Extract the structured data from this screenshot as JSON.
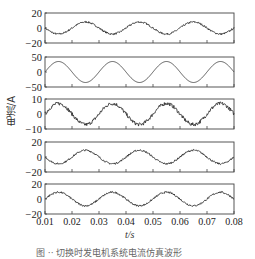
{
  "chart_data": {
    "type": "line",
    "layout": "5 vertically stacked subplots sharing x-axis",
    "xlabel": "t/s",
    "ylabel": "电流/A",
    "xlim": [
      0.01,
      0.08
    ],
    "xticks": [
      "0.01",
      "0.02",
      "0.03",
      "0.04",
      "0.05",
      "0.06",
      "0.07",
      "0.08"
    ],
    "grid": false,
    "legend": null,
    "panels": [
      {
        "name": "panel-1",
        "ylim": [
          -20,
          20
        ],
        "yticks": [
          "20",
          "0",
          "-20"
        ],
        "waveform": "sine",
        "frequency_hz": 50,
        "amplitude": 8,
        "phase": "negative-sine",
        "noise": "moderate"
      },
      {
        "name": "panel-2",
        "ylim": [
          -50,
          50
        ],
        "yticks": [
          "50",
          "0",
          "-50"
        ],
        "waveform": "sine",
        "frequency_hz": 50,
        "amplitude": 35,
        "phase": "positive-sine",
        "noise": "none"
      },
      {
        "name": "panel-3",
        "ylim": [
          -10,
          10
        ],
        "yticks": [
          "10",
          "0",
          "-10"
        ],
        "waveform": "sine",
        "frequency_hz": 50,
        "amplitude": 7,
        "phase": "positive-sine",
        "noise": "high"
      },
      {
        "name": "panel-4",
        "ylim": [
          -20,
          20
        ],
        "yticks": [
          "20",
          "0",
          "-20"
        ],
        "waveform": "sine",
        "frequency_hz": 50,
        "amplitude": 9,
        "phase": "negative-sine",
        "noise": "moderate"
      },
      {
        "name": "panel-5",
        "ylim": [
          -20,
          20
        ],
        "yticks": [
          "20",
          "0",
          "-20"
        ],
        "waveform": "sine",
        "frequency_hz": 50,
        "amplitude": 9,
        "phase": "positive-sine",
        "noise": "moderate"
      }
    ]
  },
  "labels": {
    "xlabel": "t/s",
    "ylabel": "电流/A",
    "caption": "图 ·· 切换时发电机系统电流仿真波形"
  }
}
